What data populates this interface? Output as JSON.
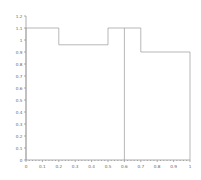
{
  "chart_data": {
    "type": "bar",
    "title": "",
    "subtitle": "",
    "xlabel": "",
    "ylabel": "",
    "xlim": [
      0,
      1
    ],
    "ylim": [
      0,
      1.2
    ],
    "grid": false,
    "legend": null,
    "annotations": [],
    "xticks": [
      "0",
      "0.1",
      "0.2",
      "0.3",
      "0.4",
      "0.5",
      "0.6",
      "0.7",
      "0.8",
      "0.9",
      "1"
    ],
    "xtick_values": [
      0,
      0.1,
      0.2,
      0.3,
      0.4,
      0.5,
      0.6,
      0.7,
      0.8,
      0.9,
      1
    ],
    "yticks": [
      "0",
      "0.1",
      "0.2",
      "0.3",
      "0.4",
      "0.5",
      "0.6",
      "0.7",
      "0.8",
      "0.9",
      "1",
      "1.1",
      "1.2"
    ],
    "ytick_values": [
      0,
      0.1,
      0.2,
      0.3,
      0.4,
      0.5,
      0.6,
      0.7,
      0.8,
      0.9,
      1.0,
      1.1,
      1.2
    ],
    "bars": [
      {
        "x0": 0.0,
        "x1": 0.2,
        "value": 1.1
      },
      {
        "x0": 0.2,
        "x1": 0.5,
        "value": 0.96
      },
      {
        "x0": 0.5,
        "x1": 0.6,
        "value": 1.1
      },
      {
        "x0": 0.6,
        "x1": 0.7,
        "value": 1.1
      },
      {
        "x0": 0.7,
        "x1": 1.0,
        "value": 0.9
      }
    ],
    "categories": [
      "0.0-0.2",
      "0.2-0.5",
      "0.5-0.6",
      "0.6-0.7",
      "0.7-1.0"
    ],
    "values": [
      1.1,
      0.96,
      1.1,
      1.1,
      0.9
    ],
    "line_color": "#9a9a9a",
    "axis_color": "#8a8a8a",
    "background": "#ffffff"
  }
}
